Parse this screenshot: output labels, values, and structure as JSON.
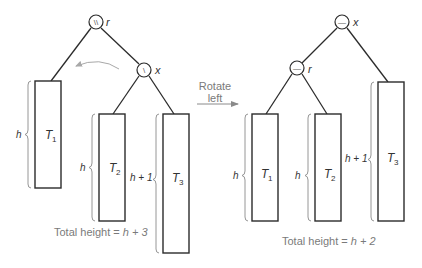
{
  "diagram": {
    "rotation_label_line1": "Rotate",
    "rotation_label_line2": "left",
    "before": {
      "nodes": [
        {
          "id": "r",
          "label": "r",
          "balance_symbol": "\\\\",
          "meaning": "doubly right-heavy"
        },
        {
          "id": "x",
          "label": "x",
          "balance_symbol": "\\",
          "meaning": "right-heavy"
        }
      ],
      "subtrees": [
        {
          "name": "T",
          "sub": "1",
          "height_label": "h"
        },
        {
          "name": "T",
          "sub": "2",
          "height_label": "h"
        },
        {
          "name": "T",
          "sub": "3",
          "height_label": "h + 1"
        }
      ],
      "total_height_prefix": "Total height = ",
      "total_height_value": "h + 3"
    },
    "after": {
      "nodes": [
        {
          "id": "x",
          "label": "x",
          "balance_symbol": "—",
          "meaning": "balanced"
        },
        {
          "id": "r",
          "label": "r",
          "balance_symbol": "—",
          "meaning": "balanced"
        }
      ],
      "subtrees": [
        {
          "name": "T",
          "sub": "1",
          "height_label": "h"
        },
        {
          "name": "T",
          "sub": "2",
          "height_label": "h"
        },
        {
          "name": "T",
          "sub": "3",
          "height_label": "h + 1"
        }
      ],
      "total_height_prefix": "Total height = ",
      "total_height_value": "h + 2"
    }
  }
}
